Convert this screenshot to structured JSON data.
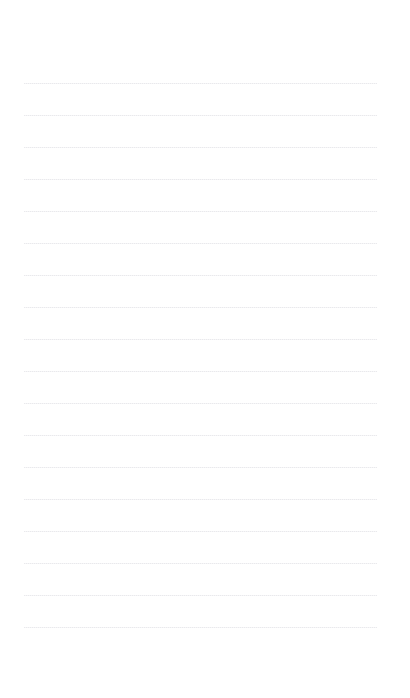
{
  "document": {
    "kind": "lined-notebook-page",
    "title": "",
    "background_color": "#ffffff",
    "width_px": 410,
    "height_px": 698
  },
  "header": {
    "title": "",
    "zone_height_px": 76
  },
  "footer": {
    "note": "",
    "page_number": "",
    "zone_top_px": 636
  },
  "ruling": {
    "line_count": 18,
    "first_line_y_px": 83,
    "line_spacing_px": 32,
    "line_start_x_px": 24,
    "line_width_px": 353,
    "line_thickness_px": 1,
    "line_color": "#eeeef0",
    "has_left_margin_rule": false,
    "lines": [
      {
        "index": 1,
        "y": 83,
        "text": ""
      },
      {
        "index": 2,
        "y": 115,
        "text": ""
      },
      {
        "index": 3,
        "y": 147,
        "text": ""
      },
      {
        "index": 4,
        "y": 179,
        "text": ""
      },
      {
        "index": 5,
        "y": 211,
        "text": ""
      },
      {
        "index": 6,
        "y": 243,
        "text": ""
      },
      {
        "index": 7,
        "y": 275,
        "text": ""
      },
      {
        "index": 8,
        "y": 307,
        "text": ""
      },
      {
        "index": 9,
        "y": 339,
        "text": ""
      },
      {
        "index": 10,
        "y": 371,
        "text": ""
      },
      {
        "index": 11,
        "y": 403,
        "text": ""
      },
      {
        "index": 12,
        "y": 435,
        "text": ""
      },
      {
        "index": 13,
        "y": 467,
        "text": ""
      },
      {
        "index": 14,
        "y": 499,
        "text": ""
      },
      {
        "index": 15,
        "y": 531,
        "text": ""
      },
      {
        "index": 16,
        "y": 563,
        "text": ""
      },
      {
        "index": 17,
        "y": 595,
        "text": ""
      },
      {
        "index": 18,
        "y": 627,
        "text": ""
      }
    ]
  }
}
